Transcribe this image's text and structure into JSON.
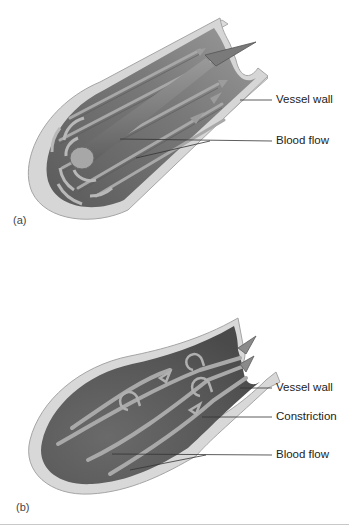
{
  "panels": [
    {
      "tag": "(a)",
      "title": "Laminar flow",
      "labels": {
        "vessel_wall": "Vessel wall",
        "blood_flow": "Blood flow"
      }
    },
    {
      "tag": "(b)",
      "title": "Turbulent flow",
      "labels": {
        "vessel_wall": "Vessel wall",
        "constriction": "Constriction",
        "blood_flow": "Blood flow"
      }
    }
  ],
  "colors": {
    "wall_outer": "#d9d9d9",
    "wall_edge": "#a9a9a9",
    "lumen": "#6f6f6f",
    "lumen_dark": "#555555",
    "stream": "#8a8a8a",
    "stream_light": "#b5b5b5",
    "leader_line": "#333333",
    "label_text": "#222222"
  }
}
